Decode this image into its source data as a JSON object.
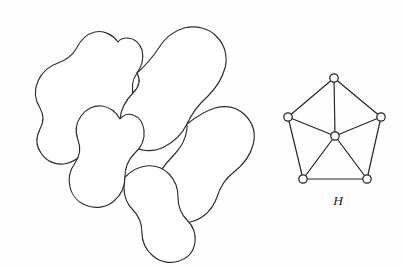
{
  "figure": {
    "caption_left": "",
    "background_color": "#fefefe",
    "stroke_color": "#2b2b2b",
    "node_fill_color": "#ffffff",
    "node_stroke_color": "#242424",
    "edge_color": "#262626"
  },
  "map_diagram": {
    "name": "planar-region-map",
    "region_count": 5,
    "regions": [
      {
        "id": "region-1",
        "label": "",
        "path": "M 118 42 C 113 35 104 30 95 32 C 86 34 80 41 76 49 C 72 56 66 60 58 63 C 49 66 42 72 38 81 C 34 90 35 100 40 108 C 44 115 44 122 40 129 C 36 137 36 146 41 153 C 46 161 55 165 64 164 C 72 163 79 158 85 152 C 92 145 100 141 109 139 C 118 137 126 131 131 123 C 136 115 137 106 134 97 C 131 88 132 80 137 73 C 142 66 144 58 142 50 C 140 43 134 38 127 38 C 123 38 120 39 118 42 Z"
      },
      {
        "id": "region-2",
        "label": "",
        "path": "M 137 73 C 145 66 152 58 158 49 C 164 39 173 31 184 28 C 196 25 209 28 217 37 C 225 45 228 57 225 68 C 222 79 216 88 208 96 C 199 104 192 113 187 124 C 182 134 174 142 164 147 C 154 152 142 152 133 146 C 124 140 119 130 120 119 C 121 109 126 100 133 93 C 139 87 141 80 137 73 Z"
      },
      {
        "id": "region-3",
        "label": "",
        "path": "M 120 119 C 116 112 110 107 102 106 C 94 105 86 109 81 116 C 76 123 75 132 78 140 C 81 148 80 156 75 163 C 70 170 68 179 70 187 C 72 196 79 203 88 206 C 97 209 107 207 114 201 C 121 195 125 186 125 177 C 125 168 128 160 134 154 C 141 148 145 139 144 130 C 143 123 139 117 133 115 C 128 113 123 115 120 119 Z"
      },
      {
        "id": "region-4",
        "label": "",
        "path": "M 187 124 C 196 117 205 111 215 108 C 226 105 237 107 245 115 C 253 123 256 134 253 145 C 250 156 243 165 234 172 C 226 178 220 187 217 197 C 213 208 205 217 194 221 C 183 225 171 223 163 215 C 155 207 152 195 155 184 C 158 173 165 164 173 156 C 181 148 186 138 187 129 Z"
      },
      {
        "id": "region-5",
        "label": "",
        "path": "M 125 177 C 131 171 138 167 146 166 C 155 165 163 168 169 174 C 175 180 178 188 178 197 C 178 206 181 214 187 220 C 193 226 196 234 195 242 C 194 251 188 258 179 261 C 170 264 160 262 153 256 C 146 250 142 242 142 233 C 142 224 139 216 133 210 C 127 204 124 196 124 188 Z"
      }
    ]
  },
  "graph": {
    "name": "wheel-graph-H",
    "label": "H",
    "label_position": {
      "x": 338,
      "y": 205
    },
    "vertex_count": 6,
    "edge_count": 10,
    "node_radius": 4.2,
    "vertices": [
      {
        "id": "v-top",
        "x": 334,
        "y": 78,
        "role": "outer"
      },
      {
        "id": "v-left",
        "x": 288,
        "y": 117,
        "role": "outer"
      },
      {
        "id": "v-right",
        "x": 381,
        "y": 117,
        "role": "outer"
      },
      {
        "id": "v-bottom-left",
        "x": 303,
        "y": 179,
        "role": "outer"
      },
      {
        "id": "v-bottom-right",
        "x": 367,
        "y": 179,
        "role": "outer"
      },
      {
        "id": "v-center",
        "x": 335,
        "y": 136,
        "role": "hub"
      }
    ],
    "edges": [
      {
        "from": "v-top",
        "to": "v-left"
      },
      {
        "from": "v-top",
        "to": "v-right"
      },
      {
        "from": "v-left",
        "to": "v-bottom-left"
      },
      {
        "from": "v-right",
        "to": "v-bottom-right"
      },
      {
        "from": "v-bottom-left",
        "to": "v-bottom-right"
      },
      {
        "from": "v-center",
        "to": "v-top"
      },
      {
        "from": "v-center",
        "to": "v-left"
      },
      {
        "from": "v-center",
        "to": "v-right"
      },
      {
        "from": "v-center",
        "to": "v-bottom-left"
      },
      {
        "from": "v-center",
        "to": "v-bottom-right"
      }
    ]
  }
}
